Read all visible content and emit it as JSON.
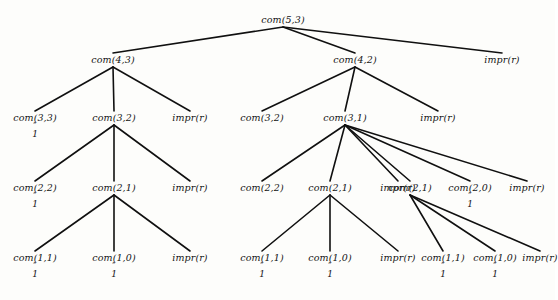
{
  "diagram": {
    "type": "recursion-tree",
    "stroke_color": "#101010",
    "text_color": "#141414",
    "background_color": "#fdfdfb"
  },
  "annotation": {
    "mark": "″",
    "value": "1"
  },
  "levels": [
    {
      "y": 22,
      "nodes": [
        {
          "id": "n0",
          "label": "com(5,3)",
          "x": 283,
          "annot": false
        }
      ]
    },
    {
      "y": 62,
      "nodes": [
        {
          "id": "n1",
          "label": "com(4,3)",
          "x": 113,
          "annot": false
        },
        {
          "id": "n2",
          "label": "com(4,2)",
          "x": 355,
          "annot": false
        },
        {
          "id": "n3",
          "label": "impr(r)",
          "x": 502,
          "annot": false
        }
      ]
    },
    {
      "y": 120,
      "nodes": [
        {
          "id": "n4",
          "label": "com(3,3)",
          "x": 35,
          "annot": true
        },
        {
          "id": "n5",
          "label": "com(3,2)",
          "x": 114,
          "annot": false
        },
        {
          "id": "n6",
          "label": "impr(r)",
          "x": 190,
          "annot": false
        },
        {
          "id": "n7",
          "label": "com(3,2)",
          "x": 262,
          "annot": false
        },
        {
          "id": "n8",
          "label": "com(3,1)",
          "x": 345,
          "annot": false
        },
        {
          "id": "n9",
          "label": "impr(r)",
          "x": 438,
          "annot": false
        }
      ]
    },
    {
      "y": 190,
      "nodes": [
        {
          "id": "n10",
          "label": "com(2,2)",
          "x": 35,
          "annot": true
        },
        {
          "id": "n11",
          "label": "com(2,1)",
          "x": 114,
          "annot": false
        },
        {
          "id": "n12",
          "label": "impr(r)",
          "x": 190,
          "annot": false
        },
        {
          "id": "n13",
          "label": "com(2,2)",
          "x": 262,
          "annot": false
        },
        {
          "id": "n14",
          "label": "com(2,1)",
          "x": 330,
          "annot": false
        },
        {
          "id": "n15",
          "label": "impr(r)",
          "x": 398,
          "annot": false
        },
        {
          "id": "n16",
          "label": "com(2,1)",
          "x": 410,
          "annot": false
        },
        {
          "id": "n17",
          "label": "com(2,0)",
          "x": 470,
          "annot": true
        },
        {
          "id": "n18",
          "label": "impr(r)",
          "x": 527,
          "annot": false
        }
      ]
    },
    {
      "y": 260,
      "nodes": [
        {
          "id": "n19",
          "label": "com(1,1)",
          "x": 35,
          "annot": true
        },
        {
          "id": "n20",
          "label": "com(1,0)",
          "x": 114,
          "annot": true
        },
        {
          "id": "n21",
          "label": "impr(r)",
          "x": 190,
          "annot": false
        },
        {
          "id": "n22",
          "label": "com(1,1)",
          "x": 262,
          "annot": true
        },
        {
          "id": "n23",
          "label": "com(1,0)",
          "x": 330,
          "annot": true
        },
        {
          "id": "n24",
          "label": "impr(r)",
          "x": 398,
          "annot": false
        },
        {
          "id": "n25",
          "label": "com(1,1)",
          "x": 443,
          "annot": true
        },
        {
          "id": "n26",
          "label": "com(1,0)",
          "x": 495,
          "annot": true
        },
        {
          "id": "n27",
          "label": "impr(r)",
          "x": 540,
          "annot": false
        }
      ]
    }
  ],
  "edges": [
    {
      "from": "n0",
      "to": "n1"
    },
    {
      "from": "n0",
      "to": "n2"
    },
    {
      "from": "n0",
      "to": "n3"
    },
    {
      "from": "n1",
      "to": "n4"
    },
    {
      "from": "n1",
      "to": "n5"
    },
    {
      "from": "n1",
      "to": "n6"
    },
    {
      "from": "n2",
      "to": "n7"
    },
    {
      "from": "n2",
      "to": "n8"
    },
    {
      "from": "n2",
      "to": "n9"
    },
    {
      "from": "n5",
      "to": "n10"
    },
    {
      "from": "n5",
      "to": "n11"
    },
    {
      "from": "n5",
      "to": "n12"
    },
    {
      "from": "n8",
      "to": "n13"
    },
    {
      "from": "n8",
      "to": "n14"
    },
    {
      "from": "n8",
      "to": "n15"
    },
    {
      "from": "n8",
      "to": "n16"
    },
    {
      "from": "n8",
      "to": "n17"
    },
    {
      "from": "n8",
      "to": "n18"
    },
    {
      "from": "n11",
      "to": "n19"
    },
    {
      "from": "n11",
      "to": "n20"
    },
    {
      "from": "n11",
      "to": "n21"
    },
    {
      "from": "n14",
      "to": "n22"
    },
    {
      "from": "n14",
      "to": "n23"
    },
    {
      "from": "n14",
      "to": "n24"
    },
    {
      "from": "n16",
      "to": "n25"
    },
    {
      "from": "n16",
      "to": "n26"
    },
    {
      "from": "n16",
      "to": "n27"
    }
  ]
}
